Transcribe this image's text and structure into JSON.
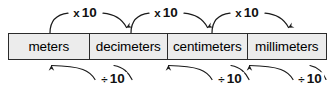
{
  "diagram": {
    "colors": {
      "box_fill": "#ececec",
      "box_border": "#2b2b2b",
      "arrow": "#1a1a1a",
      "text": "#000000",
      "background": "#ffffff"
    },
    "units": [
      {
        "label": "meters"
      },
      {
        "label": "decimeters"
      },
      {
        "label": "centimeters"
      },
      {
        "label": "millimeters"
      }
    ],
    "top_arrows": [
      {
        "label_symbol": "x",
        "label_value": "10",
        "from": "meters",
        "to": "decimeters",
        "direction": "right"
      },
      {
        "label_symbol": "x",
        "label_value": "10",
        "from": "decimeters",
        "to": "centimeters",
        "direction": "right"
      },
      {
        "label_symbol": "x",
        "label_value": "10",
        "from": "centimeters",
        "to": "millimeters",
        "direction": "right"
      }
    ],
    "bottom_arrows": [
      {
        "label_symbol": "÷",
        "label_value": "10",
        "from": "decimeters",
        "to": "meters",
        "direction": "left"
      },
      {
        "label_symbol": "÷",
        "label_value": "10",
        "from": "centimeters",
        "to": "decimeters",
        "direction": "left"
      },
      {
        "label_symbol": "÷",
        "label_value": "10",
        "from": "millimeters",
        "to": "centimeters",
        "direction": "left"
      }
    ]
  }
}
